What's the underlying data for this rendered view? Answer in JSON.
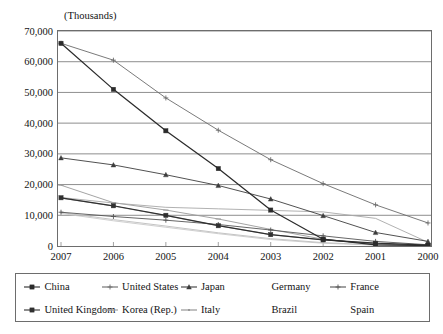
{
  "axis_caption": "(Thousands)",
  "y_ticks": [
    "70,000",
    "60,000",
    "50,000",
    "40,000",
    "30,000",
    "20,000",
    "10,000",
    "0"
  ],
  "x_ticks": [
    "2007",
    "2006",
    "2005",
    "2004",
    "2003",
    "2002",
    "2001",
    "2000"
  ],
  "legend": {
    "rows": [
      [
        {
          "label": "China",
          "color": "#2b2b2b",
          "marker": "square",
          "has_key": true
        },
        {
          "label": "United States",
          "color": "#6b6b6b",
          "marker": "cross",
          "has_key": true
        },
        {
          "label": "Japan",
          "color": "#3d3d3d",
          "marker": "triangle",
          "has_key": true
        },
        {
          "label": "Germany",
          "color": "#a8a8a8",
          "marker": "none",
          "has_key": false
        },
        {
          "label": "France",
          "color": "#555555",
          "marker": "star",
          "has_key": true
        }
      ],
      [
        {
          "label": "United Kingdom",
          "color": "#303030",
          "marker": "square",
          "has_key": true
        },
        {
          "label": "Korea (Rep.)",
          "color": "#9a9a9a",
          "marker": "dash",
          "has_key": true
        },
        {
          "label": "Italy",
          "color": "#8c8c8c",
          "marker": "line",
          "has_key": true
        },
        {
          "label": "Brazil",
          "color": "#bdbdbd",
          "marker": "none",
          "has_key": false
        },
        {
          "label": "Spain",
          "color": "#c9c9c9",
          "marker": "none",
          "has_key": false
        }
      ]
    ]
  },
  "chart_data": {
    "type": "line",
    "title": "",
    "subtitle": "",
    "xlabel": "",
    "ylabel": "(Thousands)",
    "categories": [
      "2007",
      "2006",
      "2005",
      "2004",
      "2003",
      "2002",
      "2001",
      "2000"
    ],
    "ylim": [
      0,
      70000
    ],
    "ytick_step": 10000,
    "grid": "horizontal",
    "legend_position": "bottom",
    "series": [
      {
        "name": "China",
        "color": "#2b2b2b",
        "marker": "square",
        "values": [
          66000,
          51000,
          37500,
          25200,
          11700,
          2200,
          400,
          150
        ]
      },
      {
        "name": "United States",
        "color": "#6b6b6b",
        "marker": "cross",
        "values": [
          66000,
          60500,
          48200,
          37700,
          28100,
          20300,
          13400,
          7500
        ]
      },
      {
        "name": "Japan",
        "color": "#3d3d3d",
        "marker": "triangle",
        "values": [
          28700,
          26400,
          23200,
          19700,
          15300,
          9900,
          4400,
          1500
        ]
      },
      {
        "name": "Germany",
        "color": "#a8a8a8",
        "marker": "none",
        "values": [
          15800,
          14000,
          12600,
          12100,
          11600,
          11100,
          9000,
          1200
        ]
      },
      {
        "name": "France",
        "color": "#555555",
        "marker": "star",
        "values": [
          11000,
          9600,
          8400,
          7000,
          5200,
          3300,
          1500,
          400
        ]
      },
      {
        "name": "United Kingdom",
        "color": "#303030",
        "marker": "square",
        "values": [
          15700,
          13100,
          10000,
          6600,
          3700,
          2000,
          900,
          250
        ]
      },
      {
        "name": "Korea (Rep.)",
        "color": "#9a9a9a",
        "marker": "dash",
        "values": [
          19800,
          14100,
          11700,
          8800,
          5400,
          2200,
          600,
          150
        ]
      },
      {
        "name": "Italy",
        "color": "#8c8c8c",
        "marker": "line",
        "values": [
          15600,
          13000,
          9900,
          6600,
          3700,
          2000,
          800,
          200
        ]
      },
      {
        "name": "Brazil",
        "color": "#bdbdbd",
        "marker": "none",
        "values": [
          10900,
          8600,
          6500,
          4300,
          2400,
          1100,
          350,
          100
        ]
      },
      {
        "name": "Spain",
        "color": "#c9c9c9",
        "marker": "none",
        "values": [
          10600,
          8200,
          6100,
          4000,
          2100,
          900,
          300,
          80
        ]
      }
    ]
  }
}
